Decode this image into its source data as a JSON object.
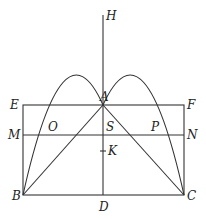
{
  "diagram": {
    "type": "geometry",
    "points": {
      "H": {
        "label": "H",
        "x": 103,
        "y": 15
      },
      "A": {
        "label": "A",
        "x": 103,
        "y": 105
      },
      "E": {
        "label": "E",
        "x": 23,
        "y": 105
      },
      "F": {
        "label": "F",
        "x": 184,
        "y": 105
      },
      "M": {
        "label": "M",
        "x": 23,
        "y": 135
      },
      "N": {
        "label": "N",
        "x": 184,
        "y": 135
      },
      "O": {
        "label": "O",
        "x": 56,
        "y": 135
      },
      "S": {
        "label": "S",
        "x": 103,
        "y": 135
      },
      "P": {
        "label": "P",
        "x": 150,
        "y": 135
      },
      "K": {
        "label": "K",
        "x": 103,
        "y": 151
      },
      "B": {
        "label": "B",
        "x": 23,
        "y": 195
      },
      "D": {
        "label": "D",
        "x": 103,
        "y": 195
      },
      "C": {
        "label": "C",
        "x": 184,
        "y": 195
      }
    },
    "segments": [
      "EF",
      "FC",
      "CB",
      "BE",
      "MN",
      "HD",
      "AB",
      "AC"
    ],
    "curves": [
      "parabola BAC"
    ]
  }
}
